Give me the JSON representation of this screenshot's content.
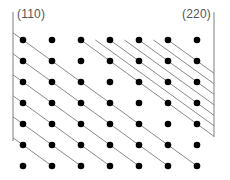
{
  "labels": {
    "left": "(110)",
    "right": "(220)"
  },
  "colors": {
    "dot": "#000000",
    "plane_line": "#8a8a8a",
    "frame": "#8a8a8a",
    "label": "#555555"
  },
  "lattice": {
    "columns": 7,
    "rows": 7,
    "x0": 23,
    "y0": 40,
    "dx": 29,
    "dy": 21,
    "dot_radius": 3.3
  },
  "frame": {
    "left_edge": {
      "x": 13,
      "y_top": 12,
      "y_bottom": 141
    },
    "right_edge": {
      "x": 214,
      "y_top": 12,
      "y_bottom": 137
    }
  },
  "planes_110": {
    "description": "lattice planes through diagonal dot sequences, starting at left edge",
    "diagonals": [
      0,
      -1,
      -2,
      -3,
      -4,
      -5
    ]
  },
  "planes_220": {
    "description": "doubled plane density in upper-right region, starting at top row",
    "diagonals": [
      2,
      2.5,
      3,
      3.5,
      4,
      4.5,
      5
    ]
  }
}
